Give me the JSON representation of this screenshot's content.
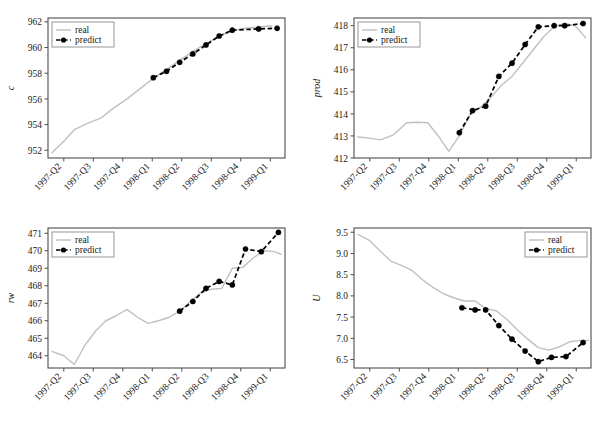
{
  "figure": {
    "layout": "2x2 grid of time-series line charts",
    "background_color": "#ffffff",
    "frame_color": "#4d4d4d"
  },
  "legend": {
    "entries": [
      {
        "label": "real",
        "color": "#c0c0c0",
        "style": "solid",
        "marker": "none"
      },
      {
        "label": "predict",
        "color": "#000000",
        "style": "dashed",
        "marker": "circle"
      }
    ]
  },
  "xticklabels": [
    "1997-Q2",
    "1997-Q3",
    "1997-Q4",
    "1998-Q1",
    "1998-Q2",
    "1998-Q3",
    "1998-Q4",
    "1999-Q1"
  ],
  "chart_data": [
    {
      "type": "line",
      "id": "panel-c",
      "title": "",
      "xlabel": "",
      "ylabel": "c",
      "xlim": [
        0,
        9
      ],
      "ylim": [
        951.4,
        962.3
      ],
      "yticks": [
        952,
        954,
        956,
        958,
        960,
        962
      ],
      "yticklabels": [
        "952",
        "954",
        "956",
        "958",
        "960",
        "962"
      ],
      "x": [
        "1997-Q2",
        "1997-Q3",
        "1997-Q4",
        "1998-Q1",
        "1998-Q2",
        "1998-Q3",
        "1998-Q4",
        "1999-Q1"
      ],
      "grid": false,
      "legend_position": "upper left",
      "series": [
        {
          "name": "real",
          "x": [
            0.15,
            0.6,
            1.0,
            1.5,
            2.0,
            2.5,
            3.0,
            3.5,
            4.0,
            4.5,
            5.0,
            5.5,
            6.0,
            6.5,
            7.0,
            7.5,
            8.0,
            8.5
          ],
          "values": [
            951.8,
            952.7,
            953.6,
            954.1,
            954.5,
            955.3,
            956.0,
            956.8,
            957.6,
            958.3,
            959.0,
            959.7,
            960.3,
            960.9,
            961.3,
            961.5,
            961.6,
            961.7
          ]
        },
        {
          "name": "predict",
          "x": [
            4.0,
            4.5,
            5.0,
            5.5,
            6.0,
            6.5,
            7.0,
            8.0,
            8.7
          ],
          "values": [
            957.65,
            958.15,
            958.85,
            959.5,
            960.2,
            960.9,
            961.35,
            961.45,
            961.5
          ]
        }
      ]
    },
    {
      "type": "line",
      "id": "panel-prod",
      "title": "",
      "xlabel": "",
      "ylabel": "prod",
      "xlim": [
        0,
        9
      ],
      "ylim": [
        412.0,
        418.35
      ],
      "yticks": [
        412,
        413,
        414,
        415,
        416,
        417,
        418
      ],
      "yticklabels": [
        "412",
        "413",
        "414",
        "415",
        "416",
        "417",
        "418"
      ],
      "x": [
        "1997-Q2",
        "1997-Q3",
        "1997-Q4",
        "1998-Q1",
        "1998-Q2",
        "1998-Q3",
        "1998-Q4",
        "1999-Q1"
      ],
      "grid": false,
      "legend_position": "upper left",
      "series": [
        {
          "name": "real",
          "x": [
            0.15,
            0.6,
            1.0,
            1.5,
            2.0,
            2.4,
            2.8,
            3.2,
            3.6,
            4.0,
            4.4,
            4.8,
            5.2,
            5.6,
            6.0,
            6.4,
            6.8,
            7.2,
            7.6,
            8.0,
            8.4,
            8.8
          ],
          "values": [
            412.95,
            412.9,
            412.82,
            413.05,
            413.6,
            413.62,
            413.6,
            413.0,
            412.3,
            413.0,
            413.95,
            414.3,
            414.75,
            415.3,
            415.7,
            416.3,
            416.9,
            417.5,
            417.95,
            418.1,
            418.0,
            417.45
          ]
        },
        {
          "name": "predict",
          "x": [
            4.0,
            4.5,
            5.0,
            5.5,
            6.0,
            6.5,
            7.0,
            7.6,
            8.0,
            8.7
          ],
          "values": [
            413.15,
            414.15,
            414.35,
            415.7,
            416.3,
            417.15,
            417.95,
            418.0,
            418.0,
            418.1
          ]
        }
      ]
    },
    {
      "type": "line",
      "id": "panel-rw",
      "title": "",
      "xlabel": "",
      "ylabel": "rw",
      "xlim": [
        0,
        9
      ],
      "ylim": [
        463.3,
        471.3
      ],
      "yticks": [
        464,
        465,
        466,
        467,
        468,
        469,
        470,
        471
      ],
      "yticklabels": [
        "464",
        "465",
        "466",
        "467",
        "468",
        "469",
        "470",
        "471"
      ],
      "x": [
        "1997-Q2",
        "1997-Q3",
        "1997-Q4",
        "1998-Q1",
        "1998-Q2",
        "1998-Q3",
        "1998-Q4",
        "1999-Q1"
      ],
      "grid": false,
      "legend_position": "upper left",
      "series": [
        {
          "name": "real",
          "x": [
            0.15,
            0.6,
            1.0,
            1.4,
            1.8,
            2.2,
            2.6,
            3.0,
            3.4,
            3.8,
            4.2,
            4.6,
            5.0,
            5.4,
            5.8,
            6.2,
            6.6,
            7.0,
            7.4,
            7.8,
            8.2,
            8.6,
            8.85
          ],
          "values": [
            464.25,
            464.0,
            463.5,
            464.6,
            465.4,
            466.0,
            466.3,
            466.65,
            466.2,
            465.85,
            466.0,
            466.2,
            466.55,
            467.1,
            467.6,
            467.8,
            467.85,
            469.0,
            469.05,
            469.6,
            470.0,
            469.95,
            469.8
          ]
        },
        {
          "name": "predict",
          "x": [
            5.0,
            5.5,
            6.0,
            6.5,
            7.0,
            7.5,
            8.1,
            8.75
          ],
          "values": [
            466.55,
            467.1,
            467.85,
            468.25,
            468.05,
            470.1,
            469.95,
            471.05
          ]
        }
      ]
    },
    {
      "type": "line",
      "id": "panel-U",
      "title": "",
      "xlabel": "",
      "ylabel": "U",
      "xlim": [
        0,
        9
      ],
      "ylim": [
        6.3,
        9.6
      ],
      "yticks": [
        6.5,
        7.0,
        7.5,
        8.0,
        8.5,
        9.0,
        9.5
      ],
      "yticklabels": [
        "6.5",
        "7.0",
        "7.5",
        "8.0",
        "8.5",
        "9.0",
        "9.5"
      ],
      "x": [
        "1997-Q2",
        "1997-Q3",
        "1997-Q4",
        "1998-Q1",
        "1998-Q2",
        "1998-Q3",
        "1998-Q4",
        "1999-Q1"
      ],
      "grid": false,
      "legend_position": "upper right",
      "series": [
        {
          "name": "real",
          "x": [
            0.15,
            0.6,
            1.0,
            1.4,
            1.8,
            2.2,
            2.6,
            3.0,
            3.4,
            3.8,
            4.2,
            4.6,
            5.0,
            5.4,
            5.8,
            6.2,
            6.6,
            7.0,
            7.4,
            7.8,
            8.2,
            8.6,
            8.9
          ],
          "values": [
            9.45,
            9.3,
            9.05,
            8.82,
            8.72,
            8.6,
            8.38,
            8.2,
            8.05,
            7.95,
            7.88,
            7.88,
            7.7,
            7.65,
            7.45,
            7.2,
            6.98,
            6.78,
            6.72,
            6.8,
            6.92,
            6.95,
            6.95
          ]
        },
        {
          "name": "predict",
          "x": [
            4.1,
            4.6,
            5.0,
            5.5,
            6.0,
            6.5,
            7.0,
            7.5,
            8.05,
            8.7
          ],
          "values": [
            7.72,
            7.67,
            7.67,
            7.3,
            6.98,
            6.7,
            6.45,
            6.55,
            6.57,
            6.9
          ]
        }
      ]
    }
  ]
}
